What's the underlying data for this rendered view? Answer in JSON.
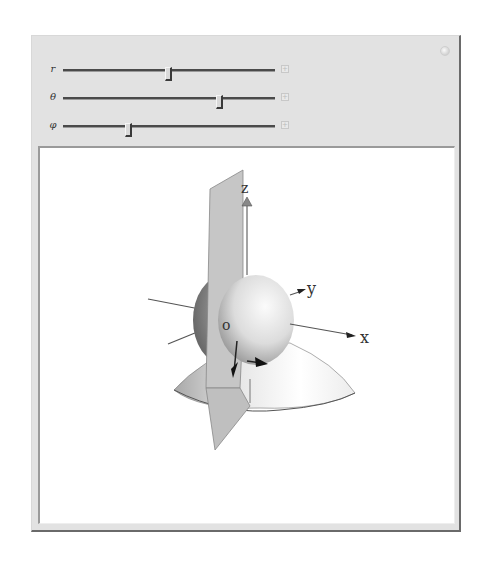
{
  "controls": {
    "sliders": [
      {
        "name": "r",
        "label": "r",
        "value_fraction": 0.5
      },
      {
        "name": "theta",
        "label": "θ",
        "value_fraction": 0.74
      },
      {
        "name": "phi",
        "label": "φ",
        "value_fraction": 0.31
      }
    ],
    "expand_button_glyph": "+",
    "options_button": "options-icon"
  },
  "plot": {
    "axis_labels": {
      "x": "x",
      "y": "y",
      "z": "z",
      "origin": "o"
    },
    "objects": [
      "sphere",
      "cone",
      "half-plane",
      "coordinate-axes",
      "unit-vector-arrows"
    ],
    "colors": {
      "surface_light": "#f4f4f4",
      "surface_dark": "#8a8a8a",
      "plane": "#c4c4c4",
      "axis": "#555555"
    }
  }
}
